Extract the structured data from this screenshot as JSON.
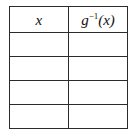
{
  "figure": {
    "type": "table",
    "border_color": "#2b2b2b",
    "background_color": "#ffffff",
    "columns": 2,
    "header_row": {
      "cells": [
        {
          "label": "x",
          "style": "italic"
        },
        {
          "base": "g",
          "superscript": "−1",
          "argument": "(x)",
          "style": "italic"
        }
      ]
    },
    "data_rows": [
      {
        "cells": [
          "",
          ""
        ]
      },
      {
        "cells": [
          "",
          ""
        ]
      },
      {
        "cells": [
          "",
          ""
        ]
      },
      {
        "cells": [
          "",
          ""
        ]
      }
    ]
  }
}
